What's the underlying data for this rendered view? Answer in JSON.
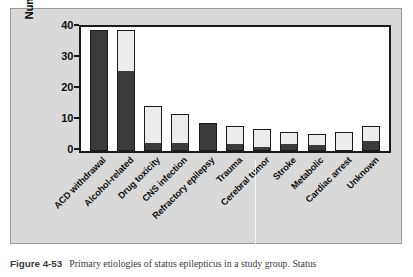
{
  "figure": {
    "caption_label": "Figure 4-53",
    "caption_text": "Primary etiologies of status epilepticus in a study group. Status"
  },
  "chart_data": {
    "type": "bar",
    "stacked": true,
    "title": "",
    "xlabel": "",
    "ylabel": "Number of patients",
    "ylim": [
      0,
      40
    ],
    "yticks": [
      0,
      10,
      20,
      30,
      40
    ],
    "ytick_labels": [
      "0",
      "10",
      "20",
      "30",
      "40"
    ],
    "grid": false,
    "legend": "none",
    "categories": [
      "ACD withdrawal",
      "Alcohol-related",
      "Drug toxicity",
      "CNS infection",
      "Refractory epilepsy",
      "Trauma",
      "Cerebral tumor",
      "Stroke",
      "Metabolic",
      "Cardiac arrest",
      "Unknown"
    ],
    "series": [
      {
        "name": "dark-segment",
        "color": "#3a3a3a",
        "values": [
          39,
          26,
          2.5,
          2.5,
          9,
          2,
          1,
          2,
          2,
          0,
          3
        ]
      },
      {
        "name": "light-segment",
        "color": "#ececec",
        "values": [
          0,
          13,
          12,
          9.5,
          0,
          6,
          6,
          4,
          3.5,
          6,
          5
        ]
      }
    ],
    "totals": [
      39,
      39,
      14.5,
      12,
      9,
      8,
      7,
      6,
      5.5,
      6,
      8
    ]
  },
  "colors": {
    "panel_background": "#d9d9d9",
    "plot_background": "#ffffff",
    "axis": "#1b1b1b",
    "dark_bar": "#3a3a3a",
    "light_bar": "#ececec"
  }
}
